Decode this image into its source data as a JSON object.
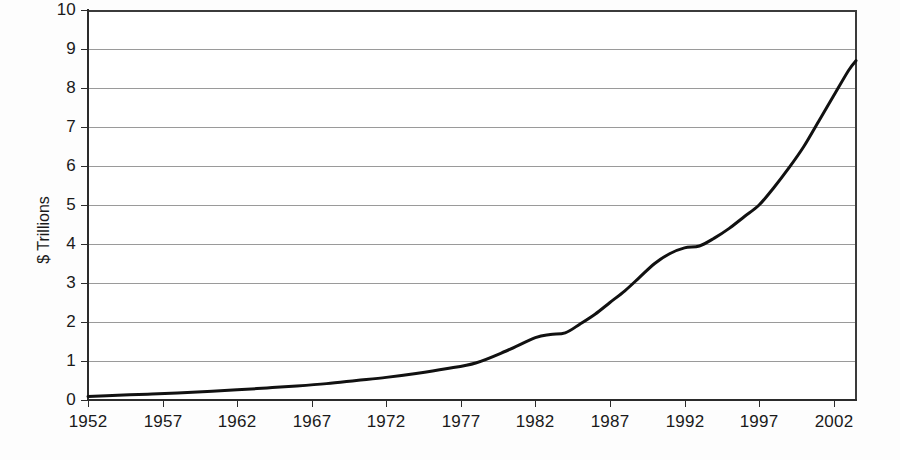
{
  "chart_data": {
    "type": "line",
    "title": "",
    "subtitle": "",
    "xlabel": "",
    "ylabel": "$ Trillions",
    "xlim": [
      1952,
      2003.5
    ],
    "ylim": [
      0,
      10
    ],
    "grid": true,
    "legend": false,
    "legend_position": "none",
    "line_color": "#111111",
    "line_width": 3,
    "y_ticks": [
      0,
      1,
      2,
      3,
      4,
      5,
      6,
      7,
      8,
      9,
      10
    ],
    "y_tick_labels": [
      "0",
      "1",
      "2",
      "3",
      "4",
      "5",
      "6",
      "7",
      "8",
      "9",
      "10"
    ],
    "x_ticks": [
      1952,
      1957,
      1962,
      1967,
      1972,
      1977,
      1982,
      1987,
      1992,
      1997,
      2002
    ],
    "x_tick_labels": [
      "1952",
      "1957",
      "1962",
      "1967",
      "1972",
      "1977",
      "1982",
      "1987",
      "1992",
      "1997",
      "2002"
    ],
    "series": [
      {
        "name": "Total",
        "x": [
          1952,
          1954,
          1956,
          1958,
          1960,
          1962,
          1964,
          1966,
          1968,
          1970,
          1972,
          1974,
          1976,
          1978,
          1980,
          1982,
          1983,
          1984,
          1985,
          1986,
          1987,
          1988,
          1989,
          1990,
          1991,
          1992,
          1993,
          1994,
          1995,
          1996,
          1997,
          1998,
          1999,
          2000,
          2001,
          2002,
          2003,
          2003.5
        ],
        "values": [
          0.09,
          0.12,
          0.15,
          0.18,
          0.22,
          0.26,
          0.31,
          0.36,
          0.42,
          0.5,
          0.58,
          0.68,
          0.8,
          0.95,
          1.25,
          1.6,
          1.68,
          1.72,
          1.95,
          2.2,
          2.5,
          2.8,
          3.15,
          3.5,
          3.75,
          3.9,
          3.95,
          4.15,
          4.4,
          4.7,
          5.0,
          5.45,
          5.95,
          6.5,
          7.15,
          7.8,
          8.45,
          8.7
        ]
      }
    ]
  }
}
